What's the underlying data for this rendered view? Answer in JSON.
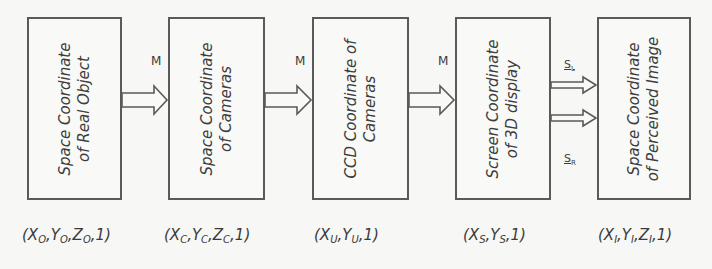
{
  "diagram": {
    "boxes": [
      {
        "line1": "Space Coordinate",
        "line2": "of Real Object"
      },
      {
        "line1": "Space Coordinate",
        "line2": "of Cameras"
      },
      {
        "line1": "CCD Coordinate of",
        "line2": "Cameras"
      },
      {
        "line1": "Screen Coordinate",
        "line2": "of 3D display"
      },
      {
        "line1": "Space Coordinate",
        "line2": "of Perceived Image"
      }
    ],
    "arrow_labels": [
      "M",
      "M",
      "M"
    ],
    "split_labels": {
      "upper": "S",
      "upper_sub": "L",
      "lower": "S",
      "lower_sub": "R"
    },
    "coordinates": [
      {
        "open": "(",
        "parts": [
          [
            "X",
            "O"
          ],
          [
            "Y",
            "O"
          ],
          [
            "Z",
            "O"
          ]
        ],
        "tail": "1)"
      },
      {
        "open": "(",
        "parts": [
          [
            "X",
            "C"
          ],
          [
            "Y",
            "C"
          ],
          [
            "Z",
            "C"
          ]
        ],
        "tail": "1)"
      },
      {
        "open": "(",
        "parts": [
          [
            "X",
            "U"
          ],
          [
            "Y",
            "U"
          ]
        ],
        "tail": ",1)"
      },
      {
        "open": "(",
        "parts": [
          [
            "X",
            "S"
          ],
          [
            "Y",
            "S"
          ]
        ],
        "tail": "1)"
      },
      {
        "open": "(",
        "parts": [
          [
            "X",
            "I"
          ],
          [
            "Y",
            "I"
          ],
          [
            "Z",
            "I"
          ]
        ],
        "tail": "1)"
      }
    ],
    "coord_text": [
      "(X_O,Y_O,Z_O,1)",
      "(X_C,Y_C,Z_C,1)",
      "(X_U,Y_U,1)",
      "(X_S,Y_S,1)",
      "(X_I,Y_I,Z_I,1)"
    ],
    "colors": {
      "stroke": "#5a5a5a",
      "background": "#f7f7f5",
      "text": "#3a3a3a"
    }
  }
}
